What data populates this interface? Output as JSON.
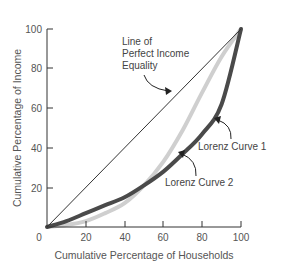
{
  "chart_data": {
    "type": "line",
    "title": "",
    "xlabel": "Cumulative Percentage of Households",
    "ylabel": "Cumulative Percentage of Income",
    "xlim": [
      0,
      100
    ],
    "ylim": [
      0,
      100
    ],
    "x_ticks": [
      "0",
      "20",
      "40",
      "60",
      "80",
      "100"
    ],
    "y_ticks": [
      "20",
      "40",
      "60",
      "80",
      "100"
    ],
    "grid": false,
    "legend": "none (inline annotations)",
    "x": [
      0,
      10,
      20,
      30,
      40,
      50,
      60,
      70,
      80,
      90,
      100
    ],
    "series": [
      {
        "name": "Line of Perfect Income Equality",
        "color": "#333333",
        "values": [
          0,
          10,
          20,
          30,
          40,
          50,
          60,
          70,
          80,
          90,
          100
        ]
      },
      {
        "name": "Lorenz Curve 1",
        "color": "#4a4a4a",
        "values": [
          0,
          3,
          7,
          11,
          15,
          21,
          28,
          37,
          47,
          62,
          100
        ]
      },
      {
        "name": "Lorenz Curve 2",
        "color": "#cfcfcf",
        "values": [
          0,
          1,
          3,
          7,
          12,
          21,
          33,
          49,
          68,
          86,
          100
        ]
      }
    ],
    "annotations": [
      {
        "text": [
          "Line of",
          "Perfect Income",
          "Equality"
        ],
        "points_to": "Line of Perfect Income Equality"
      },
      {
        "text": [
          "Lorenz Curve 1"
        ],
        "points_to": "Lorenz Curve 1"
      },
      {
        "text": [
          "Lorenz Curve 2"
        ],
        "points_to": "Lorenz Curve 2"
      }
    ]
  },
  "labels": {
    "xlabel": "Cumulative Percentage of Households",
    "ylabel": "Cumulative Percentage of Income",
    "origin": "0",
    "x20": "20",
    "x40": "40",
    "x60": "60",
    "x80": "80",
    "x100": "100",
    "y20": "20",
    "y40": "40",
    "y60": "60",
    "y80": "80",
    "y100": "100",
    "equality_1": "Line of",
    "equality_2": "Perfect Income",
    "equality_3": "Equality",
    "curve1": "Lorenz Curve 1",
    "curve2": "Lorenz Curve 2"
  }
}
